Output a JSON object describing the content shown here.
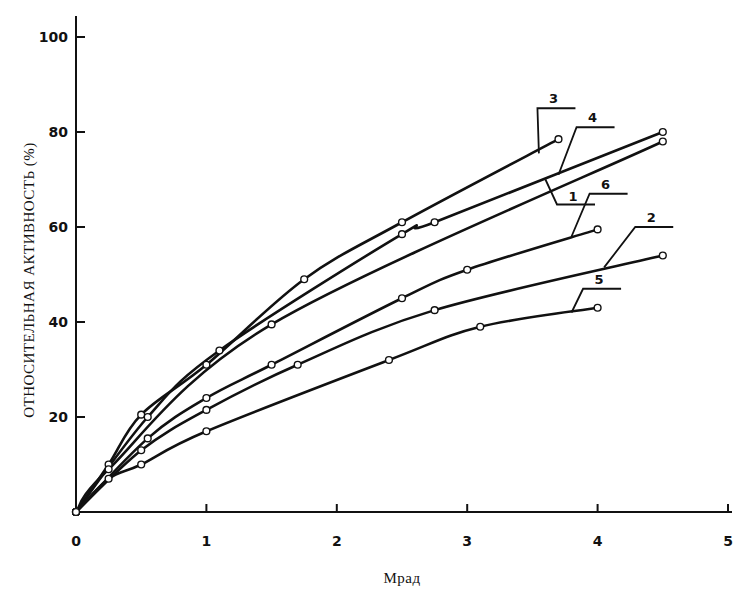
{
  "chart_data": {
    "type": "line",
    "title": "",
    "xlabel": "Мрад",
    "ylabel": "ОТНОСИТЕЛЬНАЯ АКТИВНОСТЬ (%)",
    "xlim": [
      0,
      5
    ],
    "ylim": [
      0,
      100
    ],
    "x_ticks": [
      0,
      1,
      2,
      3,
      4,
      5
    ],
    "y_ticks": [
      20,
      40,
      60,
      80,
      100
    ],
    "x_tick_labels": [
      "0",
      "1",
      "2",
      "3",
      "4",
      "5"
    ],
    "y_tick_labels": [
      "20",
      "40",
      "60",
      "80",
      "100"
    ],
    "grid": false,
    "legend": "inline callout labels at curve ends",
    "marker": "open circle",
    "series": [
      {
        "name": "3",
        "x": [
          0,
          0.25,
          0.5,
          1.0,
          1.75,
          2.5,
          3.7
        ],
        "y": [
          0,
          10,
          20.5,
          31,
          49,
          61,
          78.5
        ]
      },
      {
        "name": "4",
        "x": [
          0,
          0.55,
          1.1,
          2.5,
          2.75,
          4.5
        ],
        "y": [
          0,
          20,
          34,
          58.5,
          61,
          80
        ]
      },
      {
        "name": "1",
        "x": [
          0,
          0.25,
          1.5,
          4.5
        ],
        "y": [
          0,
          9,
          39.5,
          78
        ]
      },
      {
        "name": "6",
        "x": [
          0,
          0.55,
          1.0,
          1.5,
          2.5,
          3.0,
          4.0
        ],
        "y": [
          0,
          15.5,
          24,
          31,
          45,
          51,
          59.5
        ]
      },
      {
        "name": "2",
        "x": [
          0,
          0.5,
          1.0,
          1.7,
          2.75,
          4.5
        ],
        "y": [
          0,
          13,
          21.5,
          31,
          42.5,
          54
        ]
      },
      {
        "name": "5",
        "x": [
          0,
          0.25,
          0.5,
          1.0,
          2.4,
          3.1,
          4.0
        ],
        "y": [
          0,
          7,
          10,
          17,
          32,
          39,
          43
        ]
      }
    ],
    "callouts": [
      {
        "series": "3",
        "label": "3",
        "anchor_x": 3.55,
        "anchor_y": 75.5,
        "text_x": 3.6,
        "text_y": 85
      },
      {
        "series": "4",
        "label": "4",
        "anchor_x": 3.7,
        "anchor_y": 71,
        "text_x": 3.9,
        "text_y": 81
      },
      {
        "series": "1",
        "label": "1",
        "anchor_x": 3.6,
        "anchor_y": 70,
        "text_x": 3.75,
        "text_y": 66
      },
      {
        "series": "6",
        "label": "6",
        "anchor_x": 3.8,
        "anchor_y": 58,
        "text_x": 4.0,
        "text_y": 67
      },
      {
        "series": "2",
        "label": "2",
        "anchor_x": 4.05,
        "anchor_y": 51.5,
        "text_x": 4.35,
        "text_y": 60
      },
      {
        "series": "5",
        "label": "5",
        "anchor_x": 3.8,
        "anchor_y": 42,
        "text_x": 3.95,
        "text_y": 47
      }
    ]
  }
}
